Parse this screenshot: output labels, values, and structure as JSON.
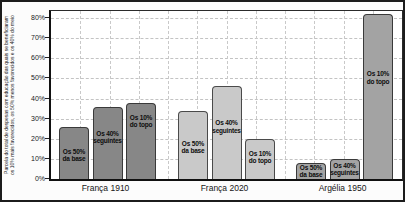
{
  "figure": {
    "ylabel_line1": "Parcela do total de despesas com educação das quais se beneficiaram",
    "ylabel_line2": "os 10% mais favorecidos, os 50% menos favorecidos e os 40% do meio"
  },
  "chart_data": {
    "type": "bar",
    "title": "",
    "xlabel": "",
    "ylabel": "Parcela do total de despesas com educação das quais se beneficiaram os 10% mais favorecidos, os 50% menos favorecidos e os 40% do meio",
    "ylim": [
      0,
      80
    ],
    "ytick_step": 10,
    "ytick_labels": [
      "0%",
      "10%",
      "20%",
      "30%",
      "40%",
      "50%",
      "60%",
      "70%",
      "80%"
    ],
    "grid": true,
    "legend": "none",
    "categories": [
      "França 1910",
      "França 2020",
      "Argélia 1950"
    ],
    "series_labels": [
      "Os 50%\nda base",
      "Os 40%\nseguintes",
      "Os 10%\ndo topo"
    ],
    "groups": [
      {
        "label": "França 1910",
        "fill": "#878787",
        "border": "#3a3a3a",
        "bars": [
          {
            "name": "Os 50%\nda base",
            "value": 26,
            "label_top": 20
          },
          {
            "name": "Os 40%\nseguintes",
            "value": 36,
            "label_top": 22
          },
          {
            "name": "Os 10%\ndo topo",
            "value": 38,
            "label_top": 10
          }
        ]
      },
      {
        "label": "França 2020",
        "fill": "#c9c9c9",
        "border": "#4a4a4a",
        "bars": [
          {
            "name": "Os 50%\nda base",
            "value": 34,
            "label_top": 28
          },
          {
            "name": "Os 40%\nseguintes",
            "value": 46,
            "label_top": 32
          },
          {
            "name": "Os 10%\ndo topo",
            "value": 20,
            "label_top": 10
          }
        ]
      },
      {
        "label": "Argélia 1950",
        "fill": "#a3a3a3",
        "border": "#3a3a3a",
        "bars": [
          {
            "name": "Os 50%\nda base",
            "value": 8,
            "label_top": 0
          },
          {
            "name": "Os 40%\nseguintes",
            "value": 10,
            "label_top": 2
          },
          {
            "name": "Os 10%\ndo topo",
            "value": 82,
            "label_top": 55
          }
        ]
      }
    ]
  },
  "layout_hints": {
    "group_starts_px": [
      8,
      127,
      245
    ],
    "bar_width_px": 30,
    "bar_spacing_px": 33.5,
    "px_per_percent": 2.0125,
    "vgrid_count": 11
  }
}
